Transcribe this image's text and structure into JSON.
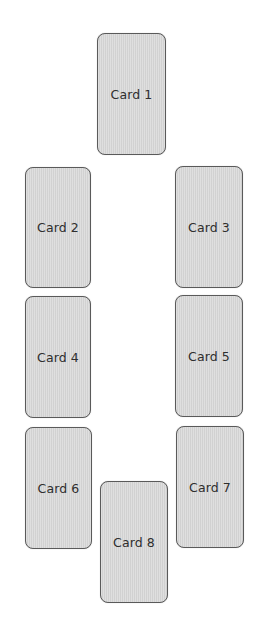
{
  "spread": {
    "cards": [
      {
        "label": "Card 1",
        "x": 97,
        "y": 33,
        "w": 69,
        "h": 122
      },
      {
        "label": "Card 2",
        "x": 25,
        "y": 167,
        "w": 66,
        "h": 121
      },
      {
        "label": "Card 3",
        "x": 175,
        "y": 166,
        "w": 68,
        "h": 122
      },
      {
        "label": "Card 4",
        "x": 25,
        "y": 296,
        "w": 66,
        "h": 122
      },
      {
        "label": "Card 5",
        "x": 175,
        "y": 295,
        "w": 68,
        "h": 122
      },
      {
        "label": "Card 6",
        "x": 25,
        "y": 427,
        "w": 67,
        "h": 122
      },
      {
        "label": "Card 7",
        "x": 176,
        "y": 426,
        "w": 68,
        "h": 122
      },
      {
        "label": "Card 8",
        "x": 100,
        "y": 481,
        "w": 68,
        "h": 122
      }
    ]
  },
  "colors": {
    "card_fill": "#d8d8d8",
    "card_border": "#5a5a5a",
    "text": "#2e2e2e",
    "background": "#ffffff"
  }
}
